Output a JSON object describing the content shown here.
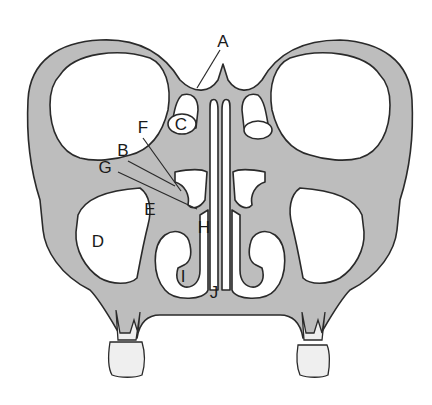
{
  "diagram": {
    "colors": {
      "bone": "#bdbdbd",
      "outline": "#2a2a2a",
      "cavity": "#ffffff"
    },
    "labels": [
      {
        "id": "A",
        "text": "A",
        "x": 223,
        "y": 41
      },
      {
        "id": "B",
        "text": "B",
        "x": 123,
        "y": 150
      },
      {
        "id": "C",
        "text": "C",
        "x": 180,
        "y": 124
      },
      {
        "id": "D",
        "text": "D",
        "x": 98,
        "y": 241
      },
      {
        "id": "E",
        "text": "E",
        "x": 150,
        "y": 209
      },
      {
        "id": "F",
        "text": "F",
        "x": 143,
        "y": 127
      },
      {
        "id": "G",
        "text": "G",
        "x": 105,
        "y": 167
      },
      {
        "id": "H",
        "text": "H",
        "x": 204,
        "y": 227
      },
      {
        "id": "I",
        "text": "I",
        "x": 183,
        "y": 276
      },
      {
        "id": "J",
        "text": "J",
        "x": 214,
        "y": 292
      }
    ]
  }
}
